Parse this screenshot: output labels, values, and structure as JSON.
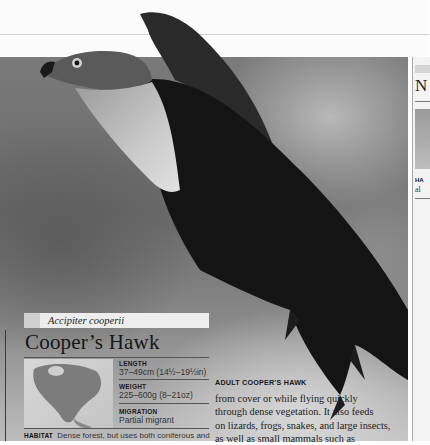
{
  "species": {
    "latin_name": "Accipiter cooperii",
    "common_name": "Cooper’s Hawk"
  },
  "stats": [
    {
      "label": "LENGTH",
      "value": "37–49cm (14½–19½in)"
    },
    {
      "label": "WEIGHT",
      "value": "225–600g (8–21oz)"
    },
    {
      "label": "MIGRATION",
      "value": "Partial migrant"
    }
  ],
  "habitat": {
    "label": "HABITAT",
    "text": "Dense forest, but uses both coniferous and"
  },
  "photo": {
    "caption": "ADULT COOPER’S HAWK"
  },
  "body": {
    "lines": [
      "from cover or while flying quickly",
      "through dense vegetation. It also feeds",
      "on lizards, frogs, snakes, and large insects,",
      "as well as small mammals such as"
    ]
  },
  "next_page": {
    "heading_fragment": "N",
    "habitat_fragment": "HA",
    "text_fragment": "al"
  },
  "colors": {
    "page_bg": "#ffffff",
    "text": "#222222",
    "rule": "#555555"
  }
}
